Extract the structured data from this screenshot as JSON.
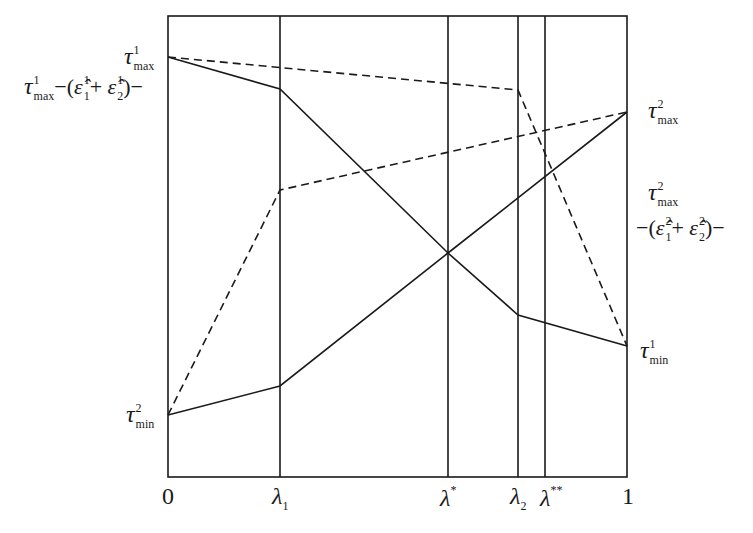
{
  "diagram": {
    "type": "piecewise-linear schedule diagram",
    "x_axis": {
      "range": [
        0,
        1
      ],
      "tick_labels": {
        "zero": "0",
        "lambda1": "λ",
        "lambda1_sub": "1",
        "lambda_star": "λ",
        "lambda_star_sup": "*",
        "lambda2": "λ",
        "lambda2_sub": "2",
        "lambda_dstar": "λ",
        "lambda_dstar_sup": "**",
        "one": "1"
      }
    },
    "left_labels": {
      "tau_max_1": {
        "base": "τ",
        "sup": "1",
        "sub": "max"
      },
      "tau_max_1_minus": {
        "base": "τ",
        "sup": "1",
        "sub": "max",
        "rest_open": "−(",
        "eps1": "ε̂",
        "eps1_sup": "1",
        "eps1_sub": "1",
        "plus": "+ ",
        "eps2": "ε̂",
        "eps2_sup": "1",
        "eps2_sub": "2",
        "rest_close": ")−"
      },
      "tau_min_2": {
        "base": "τ",
        "sup": "2",
        "sub": "min"
      }
    },
    "right_labels": {
      "tau_max_2": {
        "base": "τ",
        "sup": "2",
        "sub": "max"
      },
      "tau_max_2_minus_top": {
        "base": "τ",
        "sup": "2",
        "sub": "max"
      },
      "tau_max_2_minus_bottom": {
        "rest_open": "−(",
        "eps1": "ε̂",
        "eps1_sup": "2",
        "eps1_sub": "1",
        "plus": "+ ",
        "eps2": "ε̂",
        "eps2_sup": "2",
        "eps2_sub": "2",
        "rest_close": ")−"
      },
      "tau_min_1": {
        "base": "τ",
        "sup": "1",
        "sub": "min"
      }
    },
    "vertical_markers": [
      "0",
      "λ1",
      "λ*",
      "λ2",
      "λ**",
      "1"
    ],
    "series": [
      {
        "name": "solid-decreasing",
        "style": "solid",
        "points_label": [
          "τ¹max",
          "τ¹max−(ε̂¹₁+ε̂¹₂) at λ1",
          "crossing at λ*",
          "at λ2",
          "τ¹min at 1"
        ]
      },
      {
        "name": "solid-increasing",
        "style": "solid",
        "points_label": [
          "τ²min at 0",
          "at λ1",
          "crossing at λ*",
          "τ²max at 1"
        ]
      },
      {
        "name": "dashed-decreasing",
        "style": "dashed",
        "points_label": [
          "τ¹max at 0",
          "at λ2",
          "τ¹min at 1"
        ]
      },
      {
        "name": "dashed-increasing",
        "style": "dashed",
        "points_label": [
          "τ²min at 0",
          "at λ1",
          "τ²max at 1"
        ]
      }
    ],
    "colors": {
      "line": "#1a1a1a",
      "background": "#ffffff"
    }
  }
}
